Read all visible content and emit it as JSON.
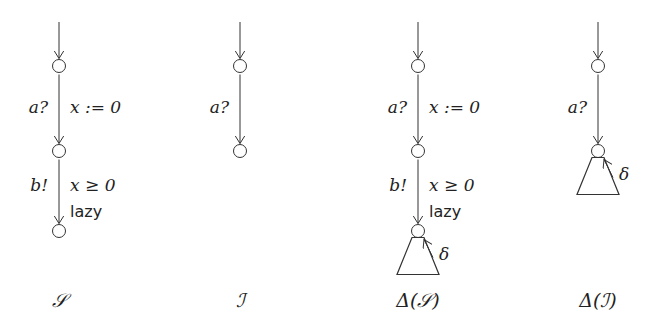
{
  "automata": [
    {
      "id": "S",
      "caption": "𝒮",
      "edges": [
        {
          "left": "a?",
          "right": "x := 0",
          "extra": ""
        },
        {
          "left": "b!",
          "right": "x ≥ 0",
          "extra": "lazy"
        }
      ],
      "delta": false
    },
    {
      "id": "I",
      "caption": "ℐ",
      "edges": [
        {
          "left": "a?",
          "right": "",
          "extra": ""
        }
      ],
      "delta": false
    },
    {
      "id": "Delta-S",
      "caption": "Δ(𝒮)",
      "edges": [
        {
          "left": "a?",
          "right": "x := 0",
          "extra": ""
        },
        {
          "left": "b!",
          "right": "x ≥ 0",
          "extra": "lazy"
        }
      ],
      "delta": true,
      "delta_label": "δ"
    },
    {
      "id": "Delta-I",
      "caption": "Δ(ℐ)",
      "edges": [
        {
          "left": "a?",
          "right": "",
          "extra": ""
        }
      ],
      "delta": true,
      "delta_label": "δ"
    }
  ]
}
